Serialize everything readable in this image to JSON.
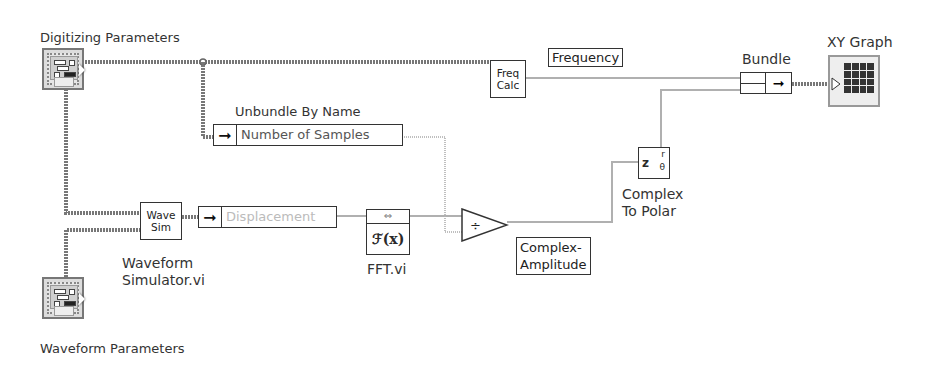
{
  "diagram": {
    "type": "LabVIEW block diagram",
    "controls": {
      "digitizing_parameters": "Digitizing Parameters",
      "waveform_parameters": "Waveform Parameters"
    },
    "nodes": {
      "freq_calc": "Freq\nCalc",
      "freq_calc_line1": "Freq",
      "freq_calc_line2": "Calc",
      "wave_sim_line1": "Wave",
      "wave_sim_line2": "Sim",
      "wave_sim_caption_line1": "Waveform",
      "wave_sim_caption_line2": "Simulator.vi",
      "unbundle_title": "Unbundle By Name",
      "unbundle_field": "Number of Samples",
      "displacement_field": "Displacement",
      "fft_glyph": "ℱ(x)",
      "fft_arrow": "⇔",
      "fft_caption": "FFT.vi",
      "divide_glyph": "÷",
      "polar_z": "z",
      "polar_r": "r",
      "polar_theta": "θ",
      "polar_caption_line1": "Complex",
      "polar_caption_line2": "To Polar",
      "bundle_title": "Bundle",
      "xy_graph_title": "XY Graph"
    },
    "indicators": {
      "frequency": "Frequency",
      "complex_amplitude_line1": "Complex-",
      "complex_amplitude_line2": "Amplitude"
    },
    "arrow_glyph": "➞",
    "colors": {
      "wire_cluster": "#8c8c8c",
      "wire_numeric": "#a8a8a8",
      "node_border": "#333333"
    }
  }
}
